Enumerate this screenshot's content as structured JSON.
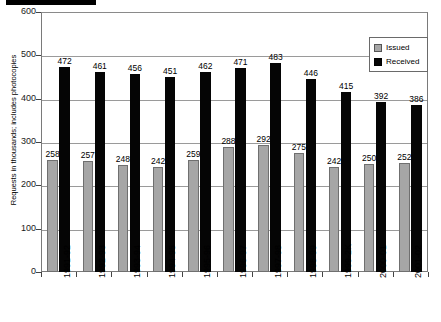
{
  "chart_data": {
    "type": "bar",
    "title": "",
    "xlabel": "",
    "ylabel": "Requests in thousands; includes photocopies",
    "ylim": [
      0,
      600
    ],
    "yticks": [
      0,
      100,
      200,
      300,
      400,
      500,
      600
    ],
    "grid": true,
    "legend_position": "top-right",
    "categories": [
      "1991-92",
      "1992-93",
      "1993-94",
      "1994-95",
      "1995-96",
      "1996-97",
      "1997-98",
      "1998-99",
      "1999-2K",
      "2000-01",
      "2001-02"
    ],
    "series": [
      {
        "name": "Issued",
        "color": "#a6a6a6",
        "values": [
          258,
          257,
          248,
          242,
          259,
          288,
          292,
          275,
          242,
          250,
          252
        ]
      },
      {
        "name": "Received",
        "color": "#050505",
        "values": [
          472,
          461,
          456,
          451,
          462,
          471,
          483,
          446,
          415,
          392,
          386
        ]
      }
    ]
  },
  "legend": {
    "items": [
      {
        "label": "Issued",
        "swatch": "issued-swatch"
      },
      {
        "label": "Received",
        "swatch": "received-swatch"
      }
    ]
  },
  "axes": {
    "y_title": "Requests in thousands; includes photocopies",
    "y_tick_labels": [
      "600",
      "500",
      "400",
      "300",
      "200",
      "100",
      "0"
    ]
  },
  "redaction": {
    "present": true,
    "label": "redacted-title-bar"
  }
}
